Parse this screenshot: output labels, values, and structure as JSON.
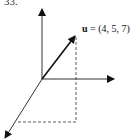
{
  "problem_number": "33.",
  "vector": {
    "name": "u",
    "equals": "=",
    "components": "(4, 5, 7)"
  },
  "colors": {
    "ink": "#111111",
    "background": "#ffffff"
  }
}
